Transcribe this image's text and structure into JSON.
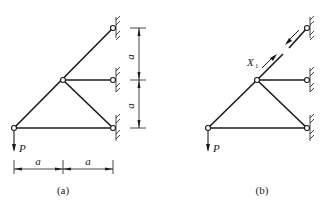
{
  "figure": {
    "panels": [
      {
        "id": "a",
        "caption": "(a)",
        "load_label": "P",
        "dimension_labels": {
          "vertical_upper": "a",
          "vertical_lower": "a",
          "horizontal_left": "a",
          "horizontal_right": "a"
        },
        "nodes": [
          "top-support",
          "middle-node",
          "middle-support",
          "bottom-left-node",
          "bottom-right-support"
        ],
        "members": [
          "top-diagonal",
          "middle-horizontal",
          "left-diagonal",
          "right-diagonal",
          "bottom-horizontal"
        ]
      },
      {
        "id": "b",
        "caption": "(b)",
        "load_label": "P",
        "redundant_label": "X",
        "redundant_subscript": "1",
        "note": "top diagonal member cut, redundant force X1 applied as pair of opposite arrows"
      }
    ]
  },
  "colors": {
    "ink": "#1a1a1a",
    "background": "#ffffff"
  }
}
